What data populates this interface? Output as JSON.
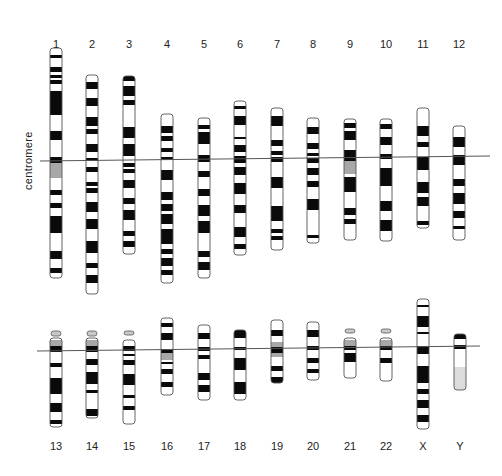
{
  "side_label": "centromere",
  "colors": {
    "dark": "#0a0a0a",
    "light": "#ffffff",
    "gray": "#a8a8a8",
    "satellite": "#c9c9c9",
    "outline": "#555555",
    "line": "#555555"
  },
  "centromere_lines": [
    {
      "x1": 40,
      "y1": 161,
      "x2": 490,
      "y2": 156
    },
    {
      "x1": 37,
      "y1": 351,
      "x2": 480,
      "y2": 346
    }
  ],
  "chromosomes": [
    {
      "label": "1",
      "x": 56,
      "label_y": 38,
      "top": 48,
      "bottom": 278,
      "bands": [
        [
          55,
          58
        ],
        [
          67,
          72
        ],
        [
          75,
          78
        ],
        [
          80,
          84
        ],
        [
          91,
          115
        ],
        [
          131,
          140
        ],
        [
          157,
          163
        ],
        [
          163,
          178,
          "g"
        ],
        [
          190,
          195
        ],
        [
          203,
          208
        ],
        [
          216,
          233
        ],
        [
          251,
          259
        ],
        [
          268,
          273
        ]
      ]
    },
    {
      "label": "2",
      "x": 92,
      "label_y": 38,
      "top": 75,
      "bottom": 294,
      "bands": [
        [
          82,
          89
        ],
        [
          98,
          106
        ],
        [
          117,
          126
        ],
        [
          129,
          134
        ],
        [
          144,
          152
        ],
        [
          158,
          161
        ],
        [
          167,
          172
        ],
        [
          182,
          186
        ],
        [
          188,
          193
        ],
        [
          202,
          212
        ],
        [
          219,
          229
        ],
        [
          241,
          253
        ],
        [
          263,
          268
        ],
        [
          275,
          283
        ]
      ]
    },
    {
      "label": "3",
      "x": 129,
      "label_y": 38,
      "top": 76,
      "bottom": 254,
      "bands": [
        [
          76,
          81
        ],
        [
          86,
          96
        ],
        [
          100,
          105
        ],
        [
          127,
          138
        ],
        [
          144,
          156
        ],
        [
          163,
          167
        ],
        [
          169,
          173
        ],
        [
          180,
          188
        ],
        [
          198,
          204
        ],
        [
          210,
          220
        ],
        [
          231,
          236
        ],
        [
          241,
          247
        ]
      ]
    },
    {
      "label": "4",
      "x": 167,
      "label_y": 38,
      "top": 114,
      "bottom": 283,
      "bands": [
        [
          126,
          133
        ],
        [
          136,
          141
        ],
        [
          148,
          152
        ],
        [
          157,
          160
        ],
        [
          170,
          180
        ],
        [
          192,
          200
        ],
        [
          204,
          211
        ],
        [
          214,
          224
        ],
        [
          229,
          244
        ],
        [
          249,
          254
        ],
        [
          258,
          266
        ],
        [
          270,
          275
        ]
      ]
    },
    {
      "label": "5",
      "x": 204,
      "label_y": 38,
      "top": 118,
      "bottom": 278,
      "bands": [
        [
          125,
          129
        ],
        [
          132,
          144
        ],
        [
          155,
          162
        ],
        [
          171,
          177
        ],
        [
          189,
          196
        ],
        [
          205,
          216
        ],
        [
          221,
          233
        ],
        [
          251,
          257
        ],
        [
          262,
          270
        ]
      ]
    },
    {
      "label": "6",
      "x": 240,
      "label_y": 38,
      "top": 101,
      "bottom": 255,
      "bands": [
        [
          106,
          109
        ],
        [
          116,
          125
        ],
        [
          137,
          139
        ],
        [
          145,
          152
        ],
        [
          156,
          163
        ],
        [
          167,
          175
        ],
        [
          183,
          194
        ],
        [
          205,
          213
        ],
        [
          227,
          237
        ],
        [
          244,
          249
        ]
      ]
    },
    {
      "label": "7",
      "x": 277,
      "label_y": 38,
      "top": 108,
      "bottom": 250,
      "bands": [
        [
          116,
          126
        ],
        [
          140,
          146
        ],
        [
          151,
          155
        ],
        [
          157,
          162
        ],
        [
          177,
          188
        ],
        [
          206,
          221
        ],
        [
          229,
          233
        ],
        [
          236,
          240
        ]
      ]
    },
    {
      "label": "8",
      "x": 313,
      "label_y": 38,
      "top": 118,
      "bottom": 243,
      "bands": [
        [
          127,
          134
        ],
        [
          143,
          149
        ],
        [
          153,
          156
        ],
        [
          158,
          163
        ],
        [
          168,
          175
        ],
        [
          181,
          187
        ],
        [
          199,
          210
        ],
        [
          235,
          238
        ]
      ]
    },
    {
      "label": "9",
      "x": 350,
      "label_y": 38,
      "top": 119,
      "bottom": 240,
      "bands": [
        [
          123,
          128
        ],
        [
          131,
          140
        ],
        [
          150,
          155
        ],
        [
          155,
          161
        ],
        [
          161,
          174,
          "g"
        ],
        [
          177,
          192
        ],
        [
          208,
          215
        ],
        [
          219,
          224
        ]
      ]
    },
    {
      "label": "10",
      "x": 386,
      "label_y": 38,
      "top": 119,
      "bottom": 241,
      "bands": [
        [
          124,
          129
        ],
        [
          137,
          145
        ],
        [
          154,
          159
        ],
        [
          168,
          186
        ],
        [
          201,
          211
        ],
        [
          220,
          231
        ]
      ]
    },
    {
      "label": "11",
      "x": 423,
      "label_y": 38,
      "top": 108,
      "bottom": 228,
      "bands": [
        [
          126,
          136
        ],
        [
          142,
          147
        ],
        [
          157,
          170
        ],
        [
          182,
          193
        ],
        [
          197,
          206
        ],
        [
          221,
          225
        ]
      ]
    },
    {
      "label": "12",
      "x": 459,
      "label_y": 38,
      "top": 126,
      "bottom": 240,
      "bands": [
        [
          137,
          147
        ],
        [
          155,
          165
        ],
        [
          179,
          186
        ],
        [
          193,
          204
        ],
        [
          211,
          218
        ],
        [
          226,
          229
        ]
      ]
    }
  ],
  "acrocentric_bottom": [
    {
      "label": "13",
      "x": 56,
      "label_y": 440,
      "top": 338,
      "bottom": 427,
      "sat": [
        331,
        336
      ],
      "stalk_gray": [
        340,
        346
      ],
      "bands": [
        [
          346,
          352
        ],
        [
          363,
          367
        ],
        [
          378,
          394
        ],
        [
          403,
          412
        ],
        [
          420,
          424
        ]
      ]
    },
    {
      "label": "14",
      "x": 92,
      "label_y": 440,
      "top": 338,
      "bottom": 418,
      "sat": [
        331,
        336
      ],
      "stalk_gray": [
        340,
        346
      ],
      "bands": [
        [
          346,
          352
        ],
        [
          359,
          365
        ],
        [
          372,
          384
        ],
        [
          390,
          393
        ],
        [
          409,
          416
        ]
      ]
    },
    {
      "label": "15",
      "x": 129,
      "label_y": 440,
      "top": 340,
      "bottom": 424,
      "sat": [
        331,
        335
      ],
      "stalk_gray": null,
      "bands": [
        [
          346,
          351
        ],
        [
          354,
          356
        ],
        [
          360,
          365
        ],
        [
          374,
          385
        ],
        [
          395,
          398
        ],
        [
          406,
          410
        ]
      ]
    },
    {
      "label": "16",
      "x": 167,
      "label_y": 440,
      "top": 318,
      "bottom": 395,
      "sat": null,
      "stalk_gray": null,
      "bands": [
        [
          323,
          327
        ],
        [
          333,
          340
        ],
        [
          349,
          353
        ],
        [
          353,
          360,
          "g"
        ],
        [
          362,
          364
        ],
        [
          369,
          374
        ],
        [
          382,
          387
        ]
      ]
    },
    {
      "label": "17",
      "x": 204,
      "label_y": 440,
      "top": 325,
      "bottom": 400,
      "sat": null,
      "stalk_gray": null,
      "bands": [
        [
          333,
          339
        ],
        [
          347,
          351
        ],
        [
          355,
          359
        ],
        [
          373,
          380
        ],
        [
          385,
          392
        ]
      ]
    },
    {
      "label": "18",
      "x": 240,
      "label_y": 440,
      "top": 330,
      "bottom": 400,
      "sat": null,
      "stalk_gray": null,
      "bands": [
        [
          330,
          338
        ],
        [
          347,
          350
        ],
        [
          358,
          370
        ],
        [
          382,
          394
        ]
      ]
    },
    {
      "label": "19",
      "x": 277,
      "label_y": 440,
      "top": 320,
      "bottom": 383,
      "sat": null,
      "stalk_gray": null,
      "bands": [
        [
          330,
          336
        ],
        [
          342,
          347,
          "g"
        ],
        [
          347,
          353
        ],
        [
          353,
          357,
          "g"
        ],
        [
          366,
          371
        ],
        [
          377,
          383
        ]
      ]
    },
    {
      "label": "20",
      "x": 313,
      "label_y": 440,
      "top": 322,
      "bottom": 380,
      "sat": null,
      "stalk_gray": null,
      "bands": [
        [
          330,
          337
        ],
        [
          346,
          350
        ],
        [
          358,
          363
        ],
        [
          369,
          373
        ]
      ]
    },
    {
      "label": "21",
      "x": 350,
      "label_y": 440,
      "top": 338,
      "bottom": 378,
      "sat": [
        329,
        333
      ],
      "stalk_gray": [
        340,
        346
      ],
      "bands": [
        [
          346,
          350
        ],
        [
          353,
          362
        ]
      ]
    },
    {
      "label": "22",
      "x": 386,
      "label_y": 440,
      "top": 338,
      "bottom": 381,
      "sat": [
        329,
        333
      ],
      "stalk_gray": [
        340,
        346
      ],
      "bands": [
        [
          346,
          350
        ],
        [
          358,
          363
        ]
      ]
    },
    {
      "label": "X",
      "x": 423,
      "label_y": 440,
      "top": 299,
      "bottom": 429,
      "sat": null,
      "stalk_gray": null,
      "bands": [
        [
          305,
          307
        ],
        [
          316,
          327
        ],
        [
          332,
          334
        ],
        [
          346,
          354
        ],
        [
          366,
          383
        ],
        [
          389,
          394
        ],
        [
          400,
          408
        ],
        [
          415,
          422
        ]
      ]
    },
    {
      "label": "Y",
      "x": 460,
      "label_y": 440,
      "top": 334,
      "bottom": 390,
      "sat": null,
      "stalk_gray": null,
      "bands": [
        [
          334,
          339
        ],
        [
          345,
          349
        ],
        [
          367,
          390,
          "l"
        ]
      ]
    }
  ]
}
